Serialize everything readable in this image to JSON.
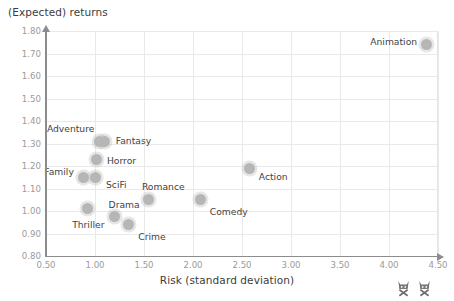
{
  "chart_data": {
    "type": "scatter",
    "title": "",
    "xlabel": "Risk (standard deviation)",
    "ylabel": "(Expected) returns",
    "xlim": [
      0.5,
      4.5
    ],
    "ylim": [
      0.8,
      1.8
    ],
    "grid": true,
    "legend_position": "none",
    "x_ticks": [
      "0.50",
      "1.00",
      "1.50",
      "2.00",
      "2.50",
      "3.00",
      "3.50",
      "4.00",
      "4.50"
    ],
    "y_ticks": [
      "0.80",
      "0.90",
      "1.00",
      "1.10",
      "1.20",
      "1.30",
      "1.40",
      "1.50",
      "1.60",
      "1.70",
      "1.80"
    ],
    "x_tick_values": [
      0.5,
      1.0,
      1.5,
      2.0,
      2.5,
      3.0,
      3.5,
      4.0,
      4.5
    ],
    "y_tick_values": [
      0.8,
      0.9,
      1.0,
      1.1,
      1.2,
      1.3,
      1.4,
      1.5,
      1.6,
      1.7,
      1.8
    ],
    "point_color": "#b6b6b6",
    "points": [
      {
        "name": "Animation",
        "x": 4.38,
        "y": 1.74,
        "label_dx": -56,
        "label_dy": -4
      },
      {
        "name": "Action",
        "x": 2.58,
        "y": 1.19,
        "label_dx": 9,
        "label_dy": 8
      },
      {
        "name": "Comedy",
        "x": 2.08,
        "y": 1.05,
        "label_dx": 9,
        "label_dy": 11
      },
      {
        "name": "Romance",
        "x": 1.55,
        "y": 1.05,
        "label_dx": -7,
        "label_dy": -14
      },
      {
        "name": "Adventure",
        "x": 1.05,
        "y": 1.31,
        "label_dx": -53,
        "label_dy": -13
      },
      {
        "name": "Fantasy",
        "x": 1.1,
        "y": 1.31,
        "label_dx": 11,
        "label_dy": -1
      },
      {
        "name": "Horror",
        "x": 1.02,
        "y": 1.23,
        "label_dx": 10,
        "label_dy": 1
      },
      {
        "name": "Family",
        "x": 0.88,
        "y": 1.15,
        "label_dx": -39,
        "label_dy": -6
      },
      {
        "name": "SciFi",
        "x": 1.0,
        "y": 1.15,
        "label_dx": 11,
        "label_dy": 7
      },
      {
        "name": "Thriller",
        "x": 0.92,
        "y": 1.01,
        "label_dx": -15,
        "label_dy": 15
      },
      {
        "name": "Drama",
        "x": 1.2,
        "y": 0.975,
        "label_dx": -6,
        "label_dy": -13
      },
      {
        "name": "Crime",
        "x": 1.34,
        "y": 0.94,
        "label_dx": 10,
        "label_dy": 11
      }
    ]
  },
  "decorations": {
    "corner_marks": [
      "cat-face-icon",
      "cat-face-icon"
    ]
  }
}
